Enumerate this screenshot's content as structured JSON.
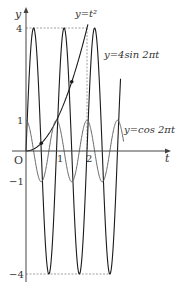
{
  "diagram": {
    "type": "function-graph",
    "axes": {
      "x_label": "t",
      "y_label": "y",
      "origin_label": "O",
      "x_ticks": [
        "1",
        "2"
      ],
      "y_ticks": [
        "4",
        "1",
        "−1",
        "−4"
      ]
    },
    "curves": [
      {
        "name": "parabola",
        "label": "y=t²",
        "formula": "t^2",
        "domain": [
          0,
          2.03
        ]
      },
      {
        "name": "sine",
        "label": "y=4sin 2πt",
        "formula": "4*sin(2*pi*t)",
        "domain": [
          0,
          3.1
        ]
      },
      {
        "name": "cosine",
        "label": "y=cos 2πt",
        "formula": "cos(2*pi*t)",
        "domain": [
          0,
          3.2
        ]
      }
    ],
    "labels": {
      "parabola": "y=t²",
      "sine": "y=4sin 2πt",
      "cosine": "y=cos 2πt"
    },
    "marked_points": [
      {
        "t": 0.5,
        "y": 0.25
      },
      {
        "t": 1.5,
        "y": 2.25
      }
    ],
    "guides": {
      "top_value": 4,
      "bottom_value": -4,
      "parabola_meet_t": 2
    },
    "colors": {
      "axis": "#444444",
      "curve_dark": "#1a1a1a",
      "curve_gray": "#666666",
      "dashed": "#888888"
    }
  }
}
